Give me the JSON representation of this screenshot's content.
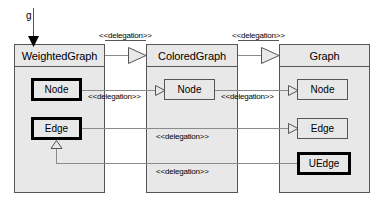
{
  "diagram": {
    "instance_label": "g",
    "stereotype": "<<delegation>>",
    "colors": {
      "box_fill": "#e8e8e8",
      "box_border": "#555555",
      "bold_border": "#000000",
      "connector": "#8a8a8a",
      "background": "#ffffff",
      "text": "#000000"
    },
    "classes": [
      {
        "id": "weightedgraph",
        "name": "WeightedGraph",
        "border": "thin",
        "members": [
          {
            "id": "wg-node",
            "name": "Node",
            "border": "bold"
          },
          {
            "id": "wg-edge",
            "name": "Edge",
            "border": "bold"
          }
        ]
      },
      {
        "id": "coloredgraph",
        "name": "ColoredGraph",
        "border": "thin",
        "members": [
          {
            "id": "cg-node",
            "name": "Node",
            "border": "thin"
          }
        ]
      },
      {
        "id": "graph",
        "name": "Graph",
        "border": "thin",
        "members": [
          {
            "id": "g-node",
            "name": "Node",
            "border": "thin"
          },
          {
            "id": "g-edge",
            "name": "Edge",
            "border": "thin"
          },
          {
            "id": "g-uedge",
            "name": "UEdge",
            "border": "bold"
          }
        ]
      }
    ],
    "connections": [
      {
        "id": "conn-class-wg-cg",
        "label": "<<delegation>>",
        "from": "WeightedGraph",
        "to": "ColoredGraph",
        "arrow": "hollow-triangle"
      },
      {
        "id": "conn-class-cg-g",
        "label": "<<delegation>>",
        "from": "ColoredGraph",
        "to": "Graph",
        "arrow": "hollow-triangle"
      },
      {
        "id": "conn-node-wg-cg",
        "label": "<<delegation>>",
        "from": "WeightedGraph.Node",
        "to": "ColoredGraph.Node",
        "arrow": "hollow-triangle"
      },
      {
        "id": "conn-node-cg-g",
        "label": "<<delegation>>",
        "from": "ColoredGraph.Node",
        "to": "Graph.Node",
        "arrow": "hollow-triangle"
      },
      {
        "id": "conn-edge-wg-g",
        "label": "<<delegation>>",
        "from": "WeightedGraph.Edge",
        "to": "Graph.Edge",
        "arrow": "hollow-triangle"
      },
      {
        "id": "conn-uedge-g-wg",
        "label": "<<delegation>>",
        "from": "Graph.UEdge",
        "to": "WeightedGraph.Edge",
        "arrow": "hollow-triangle"
      }
    ]
  }
}
